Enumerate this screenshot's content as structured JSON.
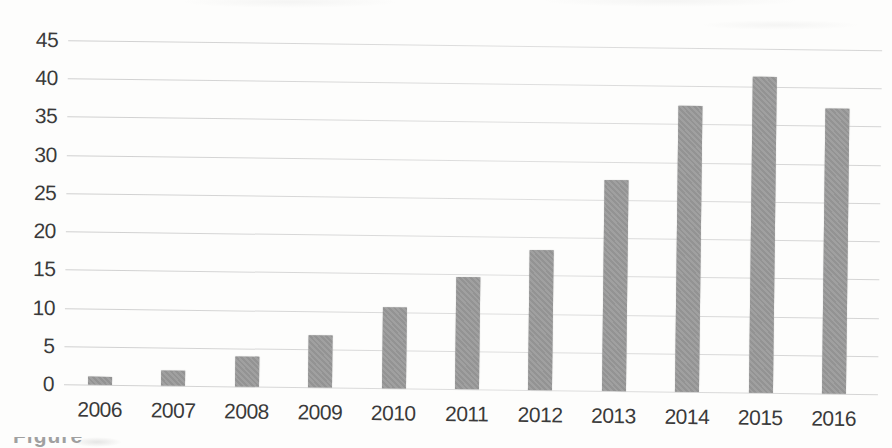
{
  "caption_fragment": "Figure",
  "chart_data": {
    "type": "bar",
    "title": "",
    "xlabel": "",
    "ylabel": "",
    "categories": [
      "2006",
      "2007",
      "2008",
      "2009",
      "2010",
      "2011",
      "2012",
      "2013",
      "2014",
      "2015",
      "2016"
    ],
    "values": [
      1.1,
      2.0,
      3.9,
      6.8,
      10.6,
      14.6,
      18.3,
      27.6,
      37.4,
      41.4,
      37.3
    ],
    "ylim": [
      0,
      45
    ],
    "ytick_step": 5,
    "yticks": [
      0,
      5,
      10,
      15,
      20,
      25,
      30,
      35,
      40,
      45
    ],
    "grid": true,
    "legend": "none",
    "bar_color": "#9b9b9b",
    "gridline_color": "#d5d5d5",
    "label_color": "#3a3a3a",
    "background_color": "#fdfdfc"
  }
}
